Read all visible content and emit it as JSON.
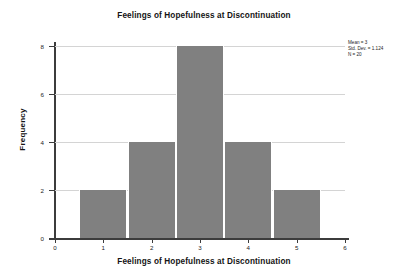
{
  "chart_data": {
    "type": "bar",
    "title": "Feelings of Hopefulness at Discontinuation",
    "xlabel": "Feelings of Hopefulness at Discontinuation",
    "ylabel": "Frequency",
    "categories": [
      1,
      2,
      3,
      4,
      5
    ],
    "values": [
      2,
      4,
      8,
      4,
      2
    ],
    "bin_edges": [
      0.5,
      1.5,
      2.5,
      3.5,
      4.5,
      5.5
    ],
    "bin_width": 1,
    "xlim": [
      0,
      6
    ],
    "ylim": [
      0,
      8
    ],
    "xticks": [
      "0",
      "1",
      "2",
      "3",
      "4",
      "5",
      "6"
    ],
    "yticks": [
      "0",
      "2",
      "4",
      "6",
      "8"
    ],
    "grid": "horizontal",
    "legend": "none",
    "bar_color": "#808080",
    "gridline_color": "#d4d4d4",
    "axis_color": "#3c3c3c",
    "background_color": "#ffffff",
    "annotations": {
      "mean": "Mean = 3",
      "std_dev": "Std. Dev. = 1.124",
      "n": "N = 20"
    }
  }
}
